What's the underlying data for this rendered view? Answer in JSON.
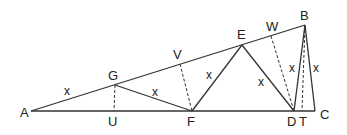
{
  "diagram": {
    "title": "",
    "points": {
      "A": [
        31,
        111
      ],
      "U": [
        114,
        111
      ],
      "F": [
        192,
        111
      ],
      "D": [
        294,
        111
      ],
      "T": [
        302,
        111
      ],
      "C": [
        315,
        111
      ],
      "G": [
        115,
        85
      ],
      "V": [
        180,
        64
      ],
      "E": [
        242,
        45
      ],
      "W": [
        271,
        36
      ],
      "B": [
        305,
        25
      ]
    },
    "labels": [
      {
        "id": "A",
        "text": "A",
        "x": 20,
        "y": 117
      },
      {
        "id": "U",
        "text": "U",
        "x": 108,
        "y": 126
      },
      {
        "id": "F",
        "text": "F",
        "x": 187,
        "y": 126
      },
      {
        "id": "D",
        "text": "D",
        "x": 287,
        "y": 126
      },
      {
        "id": "T",
        "text": "T",
        "x": 299,
        "y": 126
      },
      {
        "id": "C",
        "text": "C",
        "x": 320,
        "y": 119
      },
      {
        "id": "G",
        "text": "G",
        "x": 108,
        "y": 80
      },
      {
        "id": "V",
        "text": "V",
        "x": 173,
        "y": 59
      },
      {
        "id": "E",
        "text": "E",
        "x": 237,
        "y": 39
      },
      {
        "id": "W",
        "text": "W",
        "x": 266,
        "y": 31
      },
      {
        "id": "B",
        "text": "B",
        "x": 300,
        "y": 20
      }
    ],
    "segment_labels": [
      {
        "text": "x",
        "x": 64,
        "y": 95
      },
      {
        "text": "x",
        "x": 152,
        "y": 96
      },
      {
        "text": "x",
        "x": 206,
        "y": 79
      },
      {
        "text": "x",
        "x": 258,
        "y": 86
      },
      {
        "text": "x",
        "x": 289,
        "y": 72
      },
      {
        "text": "x",
        "x": 313,
        "y": 72
      }
    ],
    "solid_segments": [
      [
        "A",
        "C"
      ],
      [
        "A",
        "B"
      ],
      [
        "G",
        "F"
      ],
      [
        "F",
        "E"
      ],
      [
        "E",
        "D"
      ],
      [
        "D",
        "B"
      ],
      [
        "B",
        "C"
      ]
    ],
    "dashed_segments": [
      [
        "G",
        "U"
      ],
      [
        "V",
        "F"
      ],
      [
        "W",
        "D"
      ],
      [
        "B",
        "T"
      ]
    ]
  }
}
